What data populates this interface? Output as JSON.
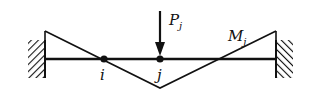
{
  "diagram": {
    "type": "fixed-fixed beam with bending moment diagram",
    "labels": {
      "node_i": "i",
      "node_j": "j",
      "load": "P",
      "load_sub": "j",
      "moment": "M",
      "moment_sub": "j"
    },
    "colors": {
      "ink": "#111111",
      "background": "#ffffff"
    }
  }
}
